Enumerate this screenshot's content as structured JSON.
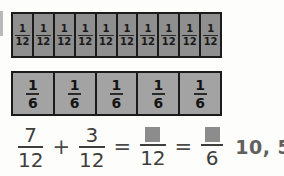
{
  "worksheet": {
    "title": "Fraction bar model: adding twelfths",
    "bars": [
      {
        "name": "twelfths-bar",
        "cell_count": 10,
        "cell_label": {
          "numerator": "1",
          "denominator": "12"
        },
        "shaded": true,
        "fill_color": "#8f8f8f",
        "border_color": "#1b1b1b"
      },
      {
        "name": "sixths-bar",
        "cell_count": 5,
        "cell_label": {
          "numerator": "1",
          "denominator": "6"
        },
        "shaded": true,
        "fill_color": "#a3a3a3",
        "border_color": "#1b1b1b"
      }
    ],
    "equation": {
      "term1": {
        "numerator": "7",
        "denominator": "12"
      },
      "operator_plus": "+",
      "term2": {
        "numerator": "3",
        "denominator": "12"
      },
      "operator_equals_1": "=",
      "result1": {
        "numerator": "",
        "denominator": "12",
        "numerator_is_blank": true
      },
      "operator_equals_2": "=",
      "result2": {
        "numerator": "",
        "denominator": "6",
        "numerator_is_blank": true
      },
      "answer": "10, 5"
    }
  },
  "colors": {
    "page_background": "#fdfdfc",
    "bar_fill_twelfths": "#8f8f8f",
    "bar_fill_sixths": "#a3a3a3",
    "bar_stroke": "#1b1b1b",
    "equation_text": "#3d3d3d",
    "answer_text": "#606060",
    "blank_square": "#8c8c8c"
  }
}
